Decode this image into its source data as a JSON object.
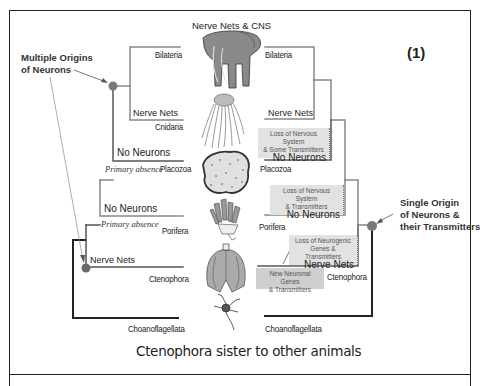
{
  "figure": {
    "panel_number": "(1)",
    "top_label": "Nerve Nets & CNS",
    "caption": "Ctenophora sister to other animals",
    "colors": {
      "line_dark": "#222222",
      "line_gray": "#8a8a8a",
      "node": "#7a7a7a",
      "note_bg": "#e2e2e2"
    }
  },
  "left_tree": {
    "annotation": {
      "line1": "Multiple Origins",
      "line2": "of Neurons"
    },
    "taxa": [
      {
        "name": "Bilateria"
      },
      {
        "name": "Cnidaria",
        "state": "Nerve Nets"
      },
      {
        "name": "Placozoa",
        "state": "No Neurons",
        "note": "Primary absence"
      },
      {
        "name": "Porifera",
        "state": "No Neurons",
        "note": "Primary absence"
      },
      {
        "name": "Ctenophora",
        "state": "Nerve Nets"
      },
      {
        "name": "Choanoflagellata"
      }
    ]
  },
  "right_tree": {
    "annotation": {
      "line1": "Single Origin",
      "line2": "of Neurons &",
      "line3": "their Transmitters"
    },
    "taxa": [
      {
        "name": "Bilateria"
      },
      {
        "name": "Nerve Nets"
      },
      {
        "name": "Placozoa",
        "loss_line1": "Loss of Nervous System",
        "loss_line2": "& Some Transmitters",
        "state": "No Neurons"
      },
      {
        "name": "Porifera",
        "loss_line1": "Loss of Nervous System",
        "loss_line2": "& Transmitters",
        "state": "No Neurons"
      },
      {
        "name": "Ctenophora",
        "loss_line1": "Loss of Neurogenic",
        "loss_line2": "Genes & Transmitters",
        "state": "Nerve Nets",
        "gain_line1": "New Neuronal Genes",
        "gain_line2": "& Transmitters"
      },
      {
        "name": "Choanoflagellata"
      }
    ]
  },
  "organisms": [
    {
      "name": "elephant",
      "represents": "Bilateria"
    },
    {
      "name": "jellyfish",
      "represents": "Cnidaria"
    },
    {
      "name": "placozoan",
      "represents": "Placozoa"
    },
    {
      "name": "sponge",
      "represents": "Porifera"
    },
    {
      "name": "comb-jelly",
      "represents": "Ctenophora"
    },
    {
      "name": "choanoflagellate-colony",
      "represents": "Choanoflagellata"
    }
  ]
}
